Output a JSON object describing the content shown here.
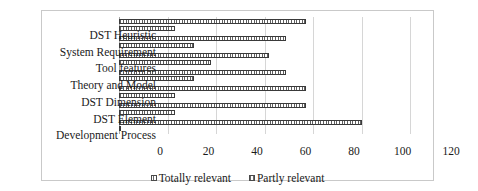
{
  "chart_data": {
    "type": "bar",
    "orientation": "horizontal",
    "title": "",
    "xlabel": "",
    "ylabel": "",
    "xlim": [
      0,
      120
    ],
    "xticks": [
      0,
      20,
      40,
      60,
      80,
      100,
      120
    ],
    "xtick_labels": [
      "0",
      "20",
      "40",
      "60",
      "80",
      "100",
      "120"
    ],
    "grid": "vertical",
    "legend_position": "bottom-center",
    "categories": [
      "DST Heuristic",
      "System Requirement",
      "Tool features",
      "Theory and Model",
      "DST Dimension",
      "DST Element",
      "Development Process"
    ],
    "series": [
      {
        "name": "Totally relevant",
        "values": [
          77,
          69,
          62,
          69,
          77,
          77,
          100
        ]
      },
      {
        "name": "Partly relevant",
        "values": [
          23,
          31,
          38,
          31,
          23,
          23,
          1
        ]
      }
    ]
  }
}
